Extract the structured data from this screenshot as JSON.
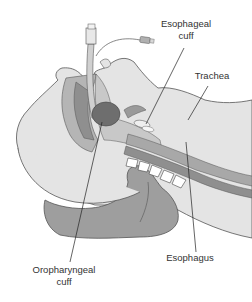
{
  "diagram": {
    "labels": {
      "esophageal_cuff_line1": "Esophageal",
      "esophageal_cuff_line2": "cuff",
      "trachea": "Trachea",
      "esophagus": "Esophagus",
      "oropharyngeal_cuff_line1": "Oropharyngeal",
      "oropharyngeal_cuff_line2": "cuff"
    },
    "colors": {
      "skin": "#e4e4e4",
      "outline": "#555555",
      "tissue_mid": "#b5b5b5",
      "tissue_dark": "#8f8f8f",
      "cuff_dark": "#6e6e6e",
      "tube": "#d0d0d0",
      "leader_line": "#222222"
    }
  }
}
